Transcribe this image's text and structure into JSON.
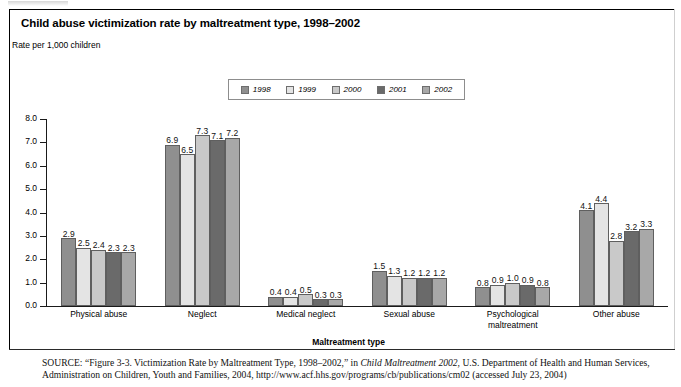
{
  "figure": {
    "title": "Child abuse victimization rate by maltreatment type, 1998–2002",
    "subtitle": "Rate per 1,000 children",
    "xaxis_title": "Maltreatment type",
    "source_prefix": "SOURCE:",
    "source_part1": " “Figure 3-3. Victimization Rate by Maltreatment Type, 1998–2002,” in ",
    "source_italic": "Child Maltreatment 2002",
    "source_part2": ", U.S. Department of Health and Human Services, Administration on Children, Youth and Families, 2004, http://www.acf.hhs.gov/programs/cb/publications/cm02 (accessed July 23, 2004)"
  },
  "chart_data": {
    "type": "bar",
    "title": "Child abuse victimization rate by maltreatment type, 1998–2002",
    "subtitle": "Rate per 1,000 children",
    "xlabel": "Maltreatment type",
    "ylabel": "",
    "ylim": [
      0,
      8
    ],
    "ytick_labels": [
      "0.0",
      "1.0",
      "2.0",
      "3.0",
      "4.0",
      "5.0",
      "6.0",
      "7.0",
      "8.0"
    ],
    "ytick_values": [
      0,
      1,
      2,
      3,
      4,
      5,
      6,
      7,
      8
    ],
    "grid": false,
    "legend_position": "top-center",
    "categories": [
      "Physical abuse",
      "Neglect",
      "Medical neglect",
      "Sexual abuse",
      "Psychological maltreatment",
      "Other abuse"
    ],
    "category_label_lines": [
      [
        "Physical abuse"
      ],
      [
        "Neglect"
      ],
      [
        "Medical neglect"
      ],
      [
        "Sexual abuse"
      ],
      [
        "Psychological",
        "maltreatment"
      ],
      [
        "Other abuse"
      ]
    ],
    "series": [
      {
        "name": "1998",
        "color": "#8f8f8f",
        "values": [
          2.9,
          6.9,
          0.4,
          1.5,
          0.8,
          4.1
        ]
      },
      {
        "name": "1999",
        "color": "#e4e4e4",
        "values": [
          2.5,
          6.5,
          0.4,
          1.3,
          0.9,
          4.4
        ]
      },
      {
        "name": "2000",
        "color": "#c9c9c9",
        "values": [
          2.4,
          7.3,
          0.5,
          1.2,
          1.0,
          2.8
        ]
      },
      {
        "name": "2001",
        "color": "#6a6a6a",
        "values": [
          2.3,
          7.1,
          0.3,
          1.2,
          0.9,
          3.2
        ]
      },
      {
        "name": "2002",
        "color": "#a8a8a8",
        "values": [
          2.3,
          7.2,
          0.3,
          1.2,
          0.8,
          3.3
        ]
      }
    ],
    "value_labels": [
      [
        "2.9",
        "2.5",
        "2.4",
        "2.3",
        "2.3"
      ],
      [
        "6.9",
        "6.5",
        "7.3",
        "7.1",
        "7.2"
      ],
      [
        "0.4",
        "0.4",
        "0.5",
        "0.3",
        "0.3"
      ],
      [
        "1.5",
        "1.3",
        "1.2",
        "1.2",
        "1.2"
      ],
      [
        "0.8",
        "0.9",
        "1.0",
        "0.9",
        "0.8"
      ],
      [
        "4.1",
        "4.4",
        "2.8",
        "3.2",
        "3.3"
      ]
    ]
  }
}
